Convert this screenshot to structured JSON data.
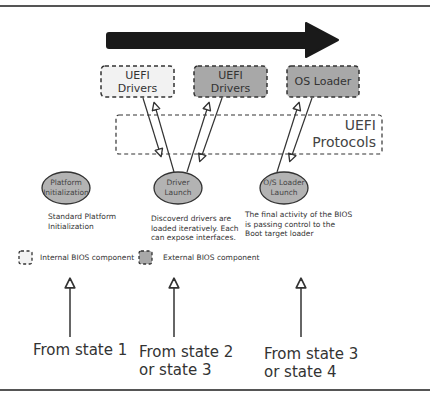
{
  "diagram": {
    "colors": {
      "internal_fill": "#f2f2f2",
      "external_fill": "#a8a8a8",
      "ellipse_fill": "#b3b3b3",
      "arrow_fill": "#1a1a1a",
      "line": "#333333"
    },
    "components": [
      {
        "id": "uefi-drivers-internal",
        "label_line1": "UEFI",
        "label_line2": "Drivers",
        "type": "internal"
      },
      {
        "id": "uefi-drivers-external",
        "label_line1": "UEFI",
        "label_line2": "Drivers",
        "type": "external"
      },
      {
        "id": "os-loader",
        "label_line1": "OS Loader",
        "label_line2": "",
        "type": "external"
      }
    ],
    "protocols": {
      "line1": "UEFI",
      "line2": "Protocols"
    },
    "phases": [
      {
        "line1": "Platform",
        "line2": "Initialization",
        "description": [
          "Standard Platform",
          "Initialization"
        ]
      },
      {
        "line1": "Driver",
        "line2": "Launch",
        "description": [
          "Discoverd drivers are",
          "loaded iteratively. Each",
          "can expose interfaces."
        ]
      },
      {
        "line1": "O/S Loader",
        "line2": "Launch",
        "description": [
          "The final activity of the BIOS",
          "is passing control to the",
          "Boot target loader"
        ]
      }
    ],
    "legend": {
      "internal": "Internal BIOS component",
      "external": "External BIOS component"
    },
    "entry_points": [
      {
        "line1": "From state 1",
        "line2": ""
      },
      {
        "line1": "From state 2",
        "line2": "or state 3"
      },
      {
        "line1": "From state 3",
        "line2": "or state 4"
      }
    ]
  }
}
